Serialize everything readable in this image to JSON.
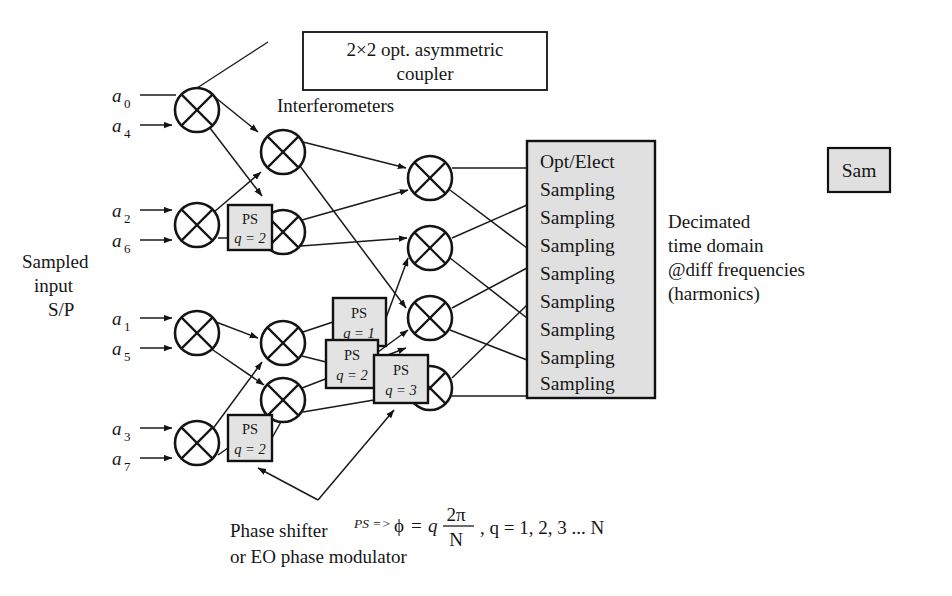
{
  "figure": {
    "background": "#ffffff",
    "ink": "#161616",
    "box_fill": "#e0e0e0"
  },
  "captions": {
    "coupler_box_line1": "2×2 opt. asymmetric",
    "coupler_box_line2": "coupler",
    "interferometers": "Interferometers",
    "sampled_input_line1": "Sampled",
    "sampled_input_line2": "input",
    "sampled_input_line3": "S/P",
    "decimated_line1": "Decimated",
    "decimated_line2": "time domain",
    "decimated_line3": "@diff frequencies",
    "decimated_line4": "(harmonics)",
    "phase_shifter_line1": "Phase shifter",
    "phase_shifter_line2": "or EO phase modulator",
    "sam_box": "Sam"
  },
  "formula": {
    "prefix": "PS =>",
    "phi": "ϕ",
    "equals": "=",
    "q": "q",
    "numerator": "2π",
    "denominator": "N",
    "tail": ", q = 1, 2, 3 ... N"
  },
  "inputs": [
    {
      "base": "a",
      "sub": "0"
    },
    {
      "base": "a",
      "sub": "4"
    },
    {
      "base": "a",
      "sub": "2"
    },
    {
      "base": "a",
      "sub": "6"
    },
    {
      "base": "a",
      "sub": "1"
    },
    {
      "base": "a",
      "sub": "5"
    },
    {
      "base": "a",
      "sub": "3"
    },
    {
      "base": "a",
      "sub": "7"
    }
  ],
  "phase_shifters": [
    {
      "id": "ps-stage1-lower",
      "label": "PS",
      "q_label": "q = 2",
      "q_value": 2
    },
    {
      "id": "ps-stage2-upper",
      "label": "PS",
      "q_label": "q = 1",
      "q_value": 1
    },
    {
      "id": "ps-stage2-mid",
      "label": "PS",
      "q_label": "q = 2",
      "q_value": 2
    },
    {
      "id": "ps-stage2-lower",
      "label": "PS",
      "q_label": "q = 3",
      "q_value": 3
    },
    {
      "id": "ps-stage1-bottom",
      "label": "PS",
      "q_label": "q = 2",
      "q_value": 2
    }
  ],
  "sampling_box": {
    "lines": [
      "Opt/Elect",
      "Sampling",
      "Sampling",
      "Sampling",
      "Sampling",
      "Sampling",
      "Sampling",
      "Sampling",
      "Sampling"
    ]
  },
  "couplers": {
    "count": 12,
    "column1": 4,
    "column2": 4,
    "column3": 4
  }
}
